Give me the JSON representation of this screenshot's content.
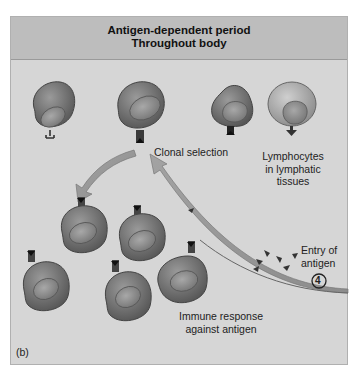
{
  "header": {
    "title_line1": "Antigen-dependent period",
    "title_line2": "Throughout body",
    "background_color": "#bdbdbd"
  },
  "panel": {
    "background_color": "#d6d6d6",
    "panel_label": "(b)"
  },
  "labels": {
    "clonal_selection": "Clonal selection",
    "lymphocytes_line1": "Lymphocytes",
    "lymphocytes_line2": "in lymphatic",
    "lymphocytes_line3": "tissues",
    "entry_line1": "Entry of",
    "entry_line2": "antigen",
    "step_number": "4",
    "immune_line1": "Immune response",
    "immune_line2": "against antigen"
  },
  "icons": {
    "cells": [
      "lymphocyte-y-receptor",
      "lymphocyte-selected",
      "lymphocyte-dark-receptor",
      "lymphocyte-arrow-receptor"
    ],
    "clones": 5,
    "antigens": 7
  }
}
